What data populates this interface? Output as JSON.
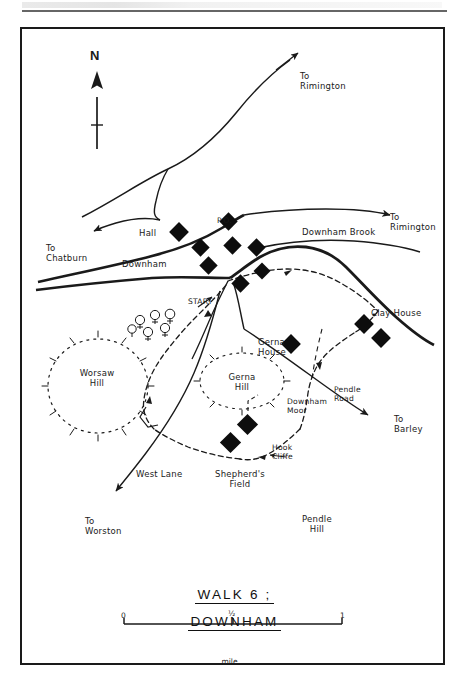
{
  "document": {
    "header_text": "",
    "title_line1": "WALK 6 ;",
    "title_line2": "DOWNHAM"
  },
  "map": {
    "compass": {
      "label": "N",
      "name": "north-arrow"
    },
    "scale": {
      "start": "0",
      "mid": "½",
      "end": "1",
      "unit": "mile"
    },
    "labels": [
      {
        "id": "to-rimington-north",
        "text": "To\nRimington",
        "x": 298,
        "y": 52
      },
      {
        "id": "to-rimington-east",
        "text": "To\nRimington",
        "x": 388,
        "y": 193
      },
      {
        "id": "to-chatburn",
        "text": "To\nChatburn",
        "x": 44,
        "y": 224
      },
      {
        "id": "hall",
        "text": "Hall",
        "x": 137,
        "y": 209
      },
      {
        "id": "po",
        "text": "P.O.",
        "x": 215,
        "y": 197
      },
      {
        "id": "downham",
        "text": "Downham",
        "x": 120,
        "y": 240
      },
      {
        "id": "downham-brook",
        "text": "Downham Brook",
        "x": 300,
        "y": 228
      },
      {
        "id": "start",
        "text": "START",
        "x": 186,
        "y": 278
      },
      {
        "id": "clay-house",
        "text": "Clay House",
        "x": 369,
        "y": 289
      },
      {
        "id": "worsaw-hill",
        "text": "Worsaw\nHill",
        "x": 52,
        "y": 349
      },
      {
        "id": "gerna-house",
        "text": "Gerna\nHouse",
        "x": 256,
        "y": 318
      },
      {
        "id": "gerna-hill",
        "text": "Gerna\nHill",
        "x": 212,
        "y": 353
      },
      {
        "id": "downham-moor",
        "text": "Downham\nMoor",
        "x": 285,
        "y": 378
      },
      {
        "id": "pendle-road",
        "text": "Pendle\nRoad",
        "x": 332,
        "y": 366
      },
      {
        "id": "to-barley",
        "text": "To\nBarley",
        "x": 392,
        "y": 395
      },
      {
        "id": "hook-cliffe",
        "text": "Hook\nCliffe",
        "x": 270,
        "y": 424
      },
      {
        "id": "shepherds-field",
        "text": "Shepherd's\nField",
        "x": 212,
        "y": 450
      },
      {
        "id": "west-lane",
        "text": "West Lane",
        "x": 134,
        "y": 450
      },
      {
        "id": "to-worston",
        "text": "To\nWorston",
        "x": 83,
        "y": 497
      },
      {
        "id": "pendle-hill",
        "text": "Pendle\nHill",
        "x": 291,
        "y": 495
      }
    ],
    "features": {
      "buildings_village": 8,
      "buildings_clay_house": 2,
      "buildings_gerna_house": 1,
      "buildings_shepherds_field": 2,
      "trees": 6,
      "hills_dotted": [
        "Worsaw Hill",
        "Gerna Hill"
      ]
    },
    "colors": {
      "ink": "#1a1a1a",
      "paper": "#ffffff",
      "building_fill": "#0d0d0d"
    }
  }
}
